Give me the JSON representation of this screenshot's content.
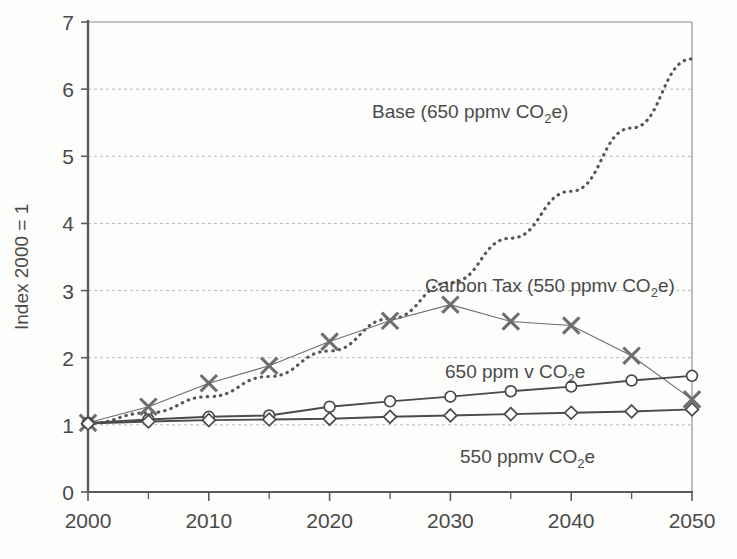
{
  "chart_data": {
    "type": "line",
    "title": "",
    "xlabel": "",
    "ylabel": "Index 2000 = 1",
    "x": [
      2000,
      2005,
      2010,
      2015,
      2020,
      2025,
      2030,
      2035,
      2040,
      2045,
      2050
    ],
    "xlim": [
      2000,
      2050
    ],
    "ylim": [
      0,
      7
    ],
    "xticks": [
      2000,
      2010,
      2020,
      2030,
      2040,
      2050
    ],
    "xtick_labels": [
      "2000",
      "2010",
      "2020",
      "2030",
      "2040",
      "2050"
    ],
    "xminor_ticks": [
      2005,
      2015,
      2025,
      2035,
      2045
    ],
    "yticks": [
      0,
      1,
      2,
      3,
      4,
      5,
      6,
      7
    ],
    "ytick_labels": [
      "0",
      "1",
      "2",
      "3",
      "4",
      "5",
      "6",
      "7"
    ],
    "grid": "horizontal-dashed",
    "legend": "inline-annotations",
    "series": [
      {
        "name": "Base (650 ppmv CO2e)",
        "label_text": "Base (650 ppmv CO",
        "label_sub": "2",
        "label_tail": "e)",
        "marker": "none",
        "linestyle": "dotted",
        "color": "#555555",
        "values": [
          1.02,
          1.18,
          1.42,
          1.72,
          2.1,
          2.58,
          3.12,
          3.78,
          4.48,
          5.42,
          6.45
        ]
      },
      {
        "name": "Carbon Tax (550 ppmv CO2e)",
        "label_text": "Carbon Tax (550 ppmv CO",
        "label_sub": "2",
        "label_tail": "e)",
        "marker": "cross",
        "linestyle": "solid-thin",
        "color": "#6e6e6e",
        "values": [
          1.03,
          1.27,
          1.62,
          1.88,
          2.24,
          2.55,
          2.79,
          2.54,
          2.48,
          2.03,
          1.38
        ]
      },
      {
        "name": "650 ppm v CO2e",
        "label_text": "650 ppm v CO",
        "label_sub": "2",
        "label_tail": "e",
        "marker": "circle",
        "linestyle": "solid",
        "color": "#4a4a4a",
        "values": [
          1.03,
          1.08,
          1.12,
          1.14,
          1.27,
          1.35,
          1.42,
          1.5,
          1.57,
          1.66,
          1.73
        ]
      },
      {
        "name": "550 ppmv CO2e",
        "label_text": "550 ppmv CO",
        "label_sub": "2",
        "label_tail": "e",
        "marker": "diamond",
        "linestyle": "solid",
        "color": "#4a4a4a",
        "values": [
          1.02,
          1.05,
          1.07,
          1.08,
          1.09,
          1.12,
          1.14,
          1.16,
          1.18,
          1.2,
          1.23
        ]
      }
    ],
    "annotations": [
      {
        "name": "base-label",
        "x": 372,
        "y": 118
      },
      {
        "name": "carbon-tax-label",
        "x": 425,
        "y": 292
      },
      {
        "name": "mid-650-label",
        "x": 445,
        "y": 378
      },
      {
        "name": "low-550-label",
        "x": 460,
        "y": 463
      }
    ]
  },
  "yaxis": {
    "title": "Index 2000 = 1",
    "labels": [
      "7",
      "6",
      "5",
      "4",
      "3",
      "2",
      "1",
      "0"
    ]
  },
  "xaxis": {
    "labels": [
      "2000",
      "2010",
      "2020",
      "2030",
      "2040",
      "2050"
    ]
  }
}
